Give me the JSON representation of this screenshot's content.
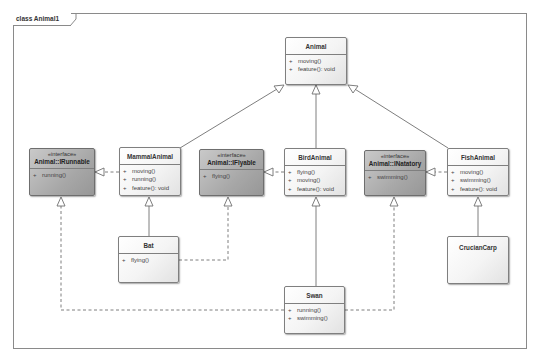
{
  "diagram": {
    "title": "class Animal1",
    "colors": {
      "class_fill": "#f4f4f4",
      "interface_fill": "#a8a8a8",
      "border": "#7f7f7f",
      "line": "#6f6f6f"
    },
    "classes": [
      {
        "id": "animal",
        "name": "Animal",
        "stereotype": "",
        "kind": "class",
        "operations": [
          {
            "vis": "+",
            "sig": "moving()"
          },
          {
            "vis": "+",
            "sig": "feature(): void"
          }
        ]
      },
      {
        "id": "irunnable",
        "name": "Animal::IRunnable",
        "stereotype": "«interface»",
        "kind": "interface",
        "operations": [
          {
            "vis": "+",
            "sig": "running()"
          }
        ]
      },
      {
        "id": "mammal",
        "name": "MammalAnimal",
        "stereotype": "",
        "kind": "class",
        "operations": [
          {
            "vis": "+",
            "sig": "moving()"
          },
          {
            "vis": "+",
            "sig": "running()"
          },
          {
            "vis": "+",
            "sig": "feature(): void"
          }
        ]
      },
      {
        "id": "iflyable",
        "name": "Animal::IFlyable",
        "stereotype": "«interface»",
        "kind": "interface",
        "operations": [
          {
            "vis": "+",
            "sig": "flying()"
          }
        ]
      },
      {
        "id": "bird",
        "name": "BirdAnimal",
        "stereotype": "",
        "kind": "class",
        "operations": [
          {
            "vis": "+",
            "sig": "flying()"
          },
          {
            "vis": "+",
            "sig": "moving()"
          },
          {
            "vis": "+",
            "sig": "feature(): void"
          }
        ]
      },
      {
        "id": "inatatory",
        "name": "Animal::INatatory",
        "stereotype": "«interface»",
        "kind": "interface",
        "operations": [
          {
            "vis": "+",
            "sig": "swimming()"
          }
        ]
      },
      {
        "id": "fish",
        "name": "FishAnimal",
        "stereotype": "",
        "kind": "class",
        "operations": [
          {
            "vis": "+",
            "sig": "moving()"
          },
          {
            "vis": "+",
            "sig": "swimming()"
          },
          {
            "vis": "+",
            "sig": "feature(): void"
          }
        ]
      },
      {
        "id": "bat",
        "name": "Bat",
        "stereotype": "",
        "kind": "class",
        "operations": [
          {
            "vis": "+",
            "sig": "flying()"
          }
        ]
      },
      {
        "id": "swan",
        "name": "Swan",
        "stereotype": "",
        "kind": "class",
        "operations": [
          {
            "vis": "+",
            "sig": "running()"
          },
          {
            "vis": "+",
            "sig": "swimming()"
          }
        ]
      },
      {
        "id": "crucian",
        "name": "CrucianCarp",
        "stereotype": "",
        "kind": "class",
        "operations": []
      }
    ],
    "relationships": [
      {
        "type": "generalization",
        "from": "MammalAnimal",
        "to": "Animal"
      },
      {
        "type": "generalization",
        "from": "BirdAnimal",
        "to": "Animal"
      },
      {
        "type": "generalization",
        "from": "FishAnimal",
        "to": "Animal"
      },
      {
        "type": "realization",
        "from": "MammalAnimal",
        "to": "Animal::IRunnable"
      },
      {
        "type": "realization",
        "from": "BirdAnimal",
        "to": "Animal::IFlyable"
      },
      {
        "type": "realization",
        "from": "FishAnimal",
        "to": "Animal::INatatory"
      },
      {
        "type": "generalization",
        "from": "Bat",
        "to": "MammalAnimal"
      },
      {
        "type": "realization",
        "from": "Bat",
        "to": "Animal::IFlyable"
      },
      {
        "type": "generalization",
        "from": "Swan",
        "to": "BirdAnimal"
      },
      {
        "type": "realization",
        "from": "Swan",
        "to": "Animal::IRunnable"
      },
      {
        "type": "realization",
        "from": "Swan",
        "to": "Animal::INatatory"
      },
      {
        "type": "generalization",
        "from": "CrucianCarp",
        "to": "FishAnimal"
      }
    ]
  }
}
